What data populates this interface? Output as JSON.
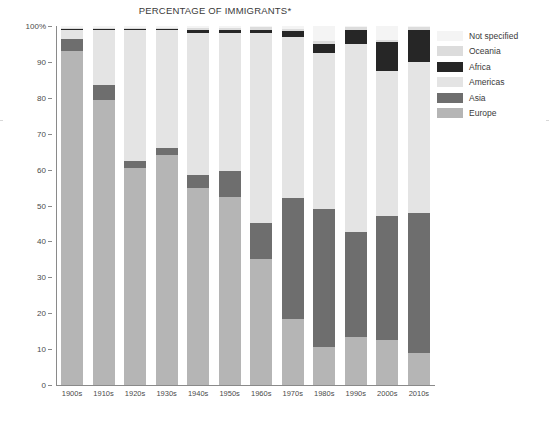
{
  "chart_data": {
    "type": "bar",
    "stacked": true,
    "title": "PERCENTAGE OF IMMIGRANTS*",
    "xlabel": "",
    "ylabel": "",
    "ylim": [
      0,
      100
    ],
    "grid": false,
    "legend_position": "right",
    "categories": [
      "1900s",
      "1910s",
      "1920s",
      "1930s",
      "1940s",
      "1950s",
      "1960s",
      "1970s",
      "1980s",
      "1990s",
      "2000s",
      "2010s"
    ],
    "ytick_labels": [
      "0",
      "10",
      "20",
      "30",
      "40",
      "50",
      "60",
      "70",
      "80",
      "90",
      "100%"
    ],
    "ytick_values": [
      0,
      10,
      20,
      30,
      40,
      50,
      60,
      70,
      80,
      90,
      100
    ],
    "series": [
      {
        "name": "Europe",
        "color": "#b5b5b5",
        "values": [
          93.0,
          79.5,
          60.5,
          64.0,
          55.0,
          52.5,
          35.0,
          18.5,
          10.5,
          13.5,
          12.5,
          9.0
        ]
      },
      {
        "name": "Asia",
        "color": "#6e6e6e",
        "values": [
          3.5,
          4.0,
          2.0,
          2.0,
          3.5,
          7.0,
          10.0,
          33.5,
          38.5,
          29.0,
          34.5,
          39.0
        ]
      },
      {
        "name": "Americas",
        "color": "#e4e4e4",
        "values": [
          2.5,
          15.5,
          36.5,
          33.0,
          39.5,
          38.5,
          53.0,
          45.0,
          43.5,
          52.5,
          40.5,
          42.0
        ]
      },
      {
        "name": "Africa",
        "color": "#262626",
        "values": [
          0.1,
          0.1,
          0.2,
          0.2,
          1.0,
          1.0,
          1.0,
          1.5,
          2.5,
          4.0,
          8.0,
          9.0
        ]
      },
      {
        "name": "Oceania",
        "color": "#dcdcdc",
        "values": [
          0.3,
          0.3,
          0.3,
          0.3,
          0.5,
          0.5,
          0.6,
          0.8,
          0.8,
          0.6,
          0.6,
          0.6
        ]
      },
      {
        "name": "Not specified",
        "color": "#f4f4f4",
        "values": [
          0.6,
          0.6,
          0.5,
          0.5,
          0.5,
          0.5,
          0.4,
          0.7,
          4.2,
          0.4,
          3.9,
          0.4
        ]
      }
    ]
  },
  "legend": {
    "items": [
      {
        "label": "Not specified",
        "color": "#f4f4f4"
      },
      {
        "label": "Oceania",
        "color": "#dcdcdc"
      },
      {
        "label": "Africa",
        "color": "#262626"
      },
      {
        "label": "Americas",
        "color": "#e4e4e4"
      },
      {
        "label": "Asia",
        "color": "#6e6e6e"
      },
      {
        "label": "Europe",
        "color": "#b5b5b5"
      }
    ]
  }
}
